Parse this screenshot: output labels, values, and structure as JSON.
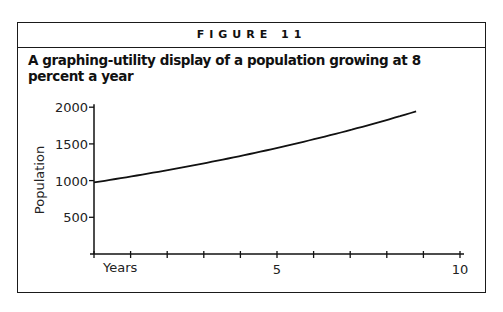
{
  "figure": {
    "label": "FIGURE 11",
    "title": "A graphing-utility display of a population growing at 8 percent a year"
  },
  "chart_data": {
    "type": "line",
    "title": "A graphing-utility display of a population growing at 8 percent a year",
    "xlabel": "Years",
    "ylabel": "Population",
    "xlim": [
      0,
      10
    ],
    "ylim": [
      0,
      2000
    ],
    "x_ticks": [
      0,
      1,
      2,
      3,
      4,
      5,
      6,
      7,
      8,
      9,
      10
    ],
    "x_tick_labels": [
      {
        "value": 5,
        "label": "5"
      },
      {
        "value": 10,
        "label": "10"
      }
    ],
    "y_ticks": [
      500,
      1000,
      1500,
      2000
    ],
    "y_tick_labels": [
      "500",
      "1000",
      "1500",
      "2000"
    ],
    "grid": false,
    "series": [
      {
        "name": "Population (P = 1000·1.08^t)",
        "x": [
          0,
          1,
          2,
          3,
          4,
          5,
          6,
          7,
          8,
          8.8
        ],
        "values": [
          1000,
          1080,
          1166,
          1260,
          1360,
          1469,
          1587,
          1714,
          1851,
          1970
        ]
      }
    ]
  }
}
